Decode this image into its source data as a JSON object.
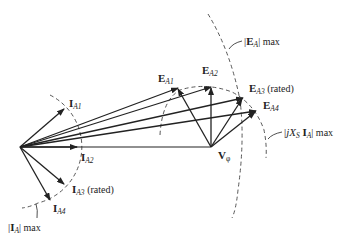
{
  "diagram": {
    "type": "phasor-diagram",
    "colors": {
      "line": "#222222",
      "dashed": "#444444",
      "background": "#ffffff"
    },
    "origin": [
      20,
      147
    ],
    "vphi_tip": [
      211,
      147
    ],
    "current_phasors": [
      {
        "id": "IA1",
        "tip": [
          64,
          109
        ]
      },
      {
        "id": "IA2",
        "tip": [
          77,
          147
        ]
      },
      {
        "id": "IA3",
        "tip": [
          64,
          184
        ]
      },
      {
        "id": "IA4",
        "tip": [
          50,
          200
        ]
      }
    ],
    "ea_phasors": [
      {
        "id": "EA1",
        "tip": [
          178,
          88
        ]
      },
      {
        "id": "EA2",
        "tip": [
          211,
          87
        ]
      },
      {
        "id": "EA3",
        "tip": [
          243,
          98
        ]
      },
      {
        "id": "EA4",
        "tip": [
          256,
          111
        ]
      }
    ],
    "labels": {
      "ia1": {
        "main": "I",
        "sub": "A1"
      },
      "ia2": {
        "main": "I",
        "sub": "A2"
      },
      "ia3": {
        "main": "I",
        "sub": "A3",
        "suffix": " (rated)"
      },
      "ia4": {
        "main": "I",
        "sub": "A4"
      },
      "ia_max": {
        "left": "|",
        "main": "I",
        "sub": "A",
        "right": "| max"
      },
      "ea1": {
        "main": "E",
        "sub": "A1"
      },
      "ea2": {
        "main": "E",
        "sub": "A2"
      },
      "ea3": {
        "main": "E",
        "sub": "A3",
        "suffix": " (rated)"
      },
      "ea4": {
        "main": "E",
        "sub": "A4"
      },
      "ea_max": {
        "left": "|",
        "main": "E",
        "sub": "A",
        "right": "| max"
      },
      "vphi": {
        "main": "V",
        "sub": "φ"
      },
      "jxs_max": {
        "left": "|",
        "j": "jX",
        "s": "S",
        "main": " I",
        "sub": "A",
        "right": "| max"
      }
    }
  }
}
